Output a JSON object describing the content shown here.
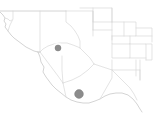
{
  "map": {
    "title": "Regional county map with location markers",
    "background_color": "#ffffff",
    "boundary_color": "#d8d8d8",
    "state_boundary_color": "#c9c9c9",
    "marker_color": "#8c8c8c",
    "width": 160,
    "height": 114,
    "markers": [
      {
        "name": "marker-upper",
        "label": "",
        "x": 58,
        "y": 48,
        "radius": 3.0,
        "color": "#8c8c8c"
      },
      {
        "name": "marker-lower",
        "label": "",
        "x": 79,
        "y": 94,
        "radius": 4.4,
        "color": "#8c8c8c"
      }
    ],
    "regions": [
      {
        "name": "northwest-panhandle",
        "label": ""
      },
      {
        "name": "north-central-county",
        "label": ""
      },
      {
        "name": "northeast-counties",
        "label": ""
      },
      {
        "name": "central-county",
        "label": ""
      },
      {
        "name": "southwest-county",
        "label": ""
      },
      {
        "name": "southeast-county",
        "label": ""
      },
      {
        "name": "east-counties",
        "label": ""
      }
    ]
  }
}
